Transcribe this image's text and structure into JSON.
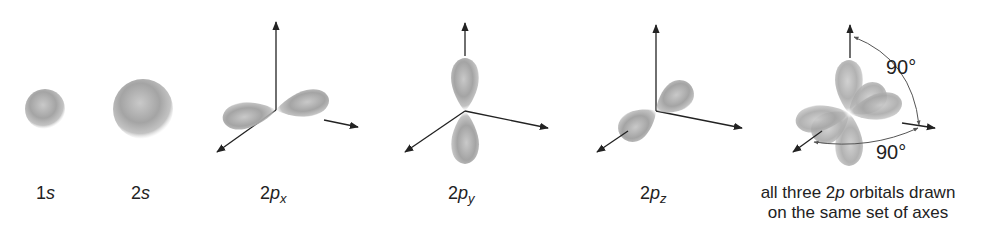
{
  "figure": {
    "colors": {
      "orbital": "#9a9a9a",
      "axis": "#222222",
      "background": "#ffffff"
    },
    "orbitals": [
      {
        "id": "1s",
        "prefix": "1",
        "letter": "s",
        "subscript": ""
      },
      {
        "id": "2s",
        "prefix": "2",
        "letter": "s",
        "subscript": ""
      },
      {
        "id": "2px",
        "prefix": "2",
        "letter": "p",
        "subscript": "x"
      },
      {
        "id": "2py",
        "prefix": "2",
        "letter": "p",
        "subscript": "y"
      },
      {
        "id": "2pz",
        "prefix": "2",
        "letter": "p",
        "subscript": "z"
      }
    ],
    "combined": {
      "caption_line1_pre": "all three 2",
      "caption_line1_italic": "p",
      "caption_line1_post": " orbitals drawn",
      "caption_line2": "on the same set of axes",
      "angle_top": "90°",
      "angle_bottom": "90°"
    }
  }
}
